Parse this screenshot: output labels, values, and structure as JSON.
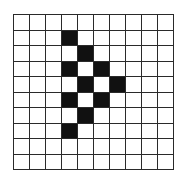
{
  "grid": {
    "rows": 10,
    "cols": 10,
    "filled_color": "#111111",
    "empty_color": "#ffffff",
    "line_color": "#2a2a2a",
    "filled_cells": [
      [
        1,
        3
      ],
      [
        2,
        4
      ],
      [
        3,
        3
      ],
      [
        3,
        5
      ],
      [
        4,
        4
      ],
      [
        4,
        6
      ],
      [
        5,
        3
      ],
      [
        5,
        5
      ],
      [
        6,
        4
      ],
      [
        7,
        3
      ]
    ]
  }
}
